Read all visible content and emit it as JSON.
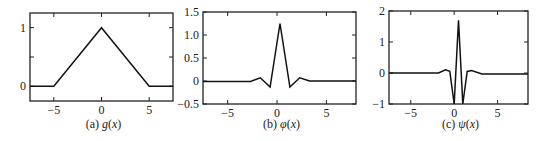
{
  "chart_data": [
    {
      "type": "line",
      "id": "a",
      "title": "",
      "caption": "(a) g(x)",
      "caption_prefix": "(a) ",
      "caption_func": "g",
      "caption_arg": "x",
      "xlabel": "",
      "ylabel": "",
      "xlim": [
        -7.5,
        7.5
      ],
      "ylim": [
        -0.25,
        1.25
      ],
      "xticks": [
        -5,
        0,
        5
      ],
      "xtick_labels": [
        "−5",
        "0",
        "5"
      ],
      "yticks": [
        0,
        0.5,
        1
      ],
      "ytick_labels": [
        "0",
        "",
        "1"
      ],
      "grid": false,
      "legend": "none",
      "series": [
        {
          "name": "g(x)",
          "x": [
            -7.5,
            -5,
            0,
            5,
            7.5
          ],
          "y": [
            0,
            0,
            1,
            0,
            0
          ]
        }
      ]
    },
    {
      "type": "line",
      "id": "b",
      "title": "",
      "caption": "(b) φ(x)",
      "caption_prefix": "(b) ",
      "caption_func": "φ",
      "caption_arg": "x",
      "xlabel": "",
      "ylabel": "",
      "xlim": [
        -7.5,
        8
      ],
      "ylim": [
        -0.5,
        1.5
      ],
      "xticks": [
        -5,
        0,
        5
      ],
      "xtick_labels": [
        "−5",
        "0",
        "5"
      ],
      "yticks": [
        -0.5,
        0,
        0.5,
        1.0,
        1.5
      ],
      "ytick_labels": [
        "−0.5",
        "0",
        "0.5",
        "1.0",
        "1.5"
      ],
      "grid": false,
      "legend": "none",
      "series": [
        {
          "name": "φ(x)",
          "x": [
            -7.5,
            -2.7,
            -1.7,
            -0.7,
            0.3,
            1.3,
            2.3,
            3.3,
            8
          ],
          "y": [
            -0.01,
            -0.01,
            0.07,
            -0.13,
            1.25,
            -0.13,
            0.07,
            0.0,
            0.0
          ]
        }
      ]
    },
    {
      "type": "line",
      "id": "c",
      "title": "",
      "caption": "(c) ψ(x)",
      "caption_prefix": "(c) ",
      "caption_func": "ψ",
      "caption_arg": "x",
      "xlabel": "",
      "ylabel": "",
      "xlim": [
        -7.5,
        8.5
      ],
      "ylim": [
        -1,
        2
      ],
      "xticks": [
        -5,
        0,
        5
      ],
      "xtick_labels": [
        "−5",
        "0",
        "5"
      ],
      "yticks": [
        -1,
        0,
        1,
        2
      ],
      "ytick_labels": [
        "−1",
        "0",
        "1",
        "2"
      ],
      "grid": false,
      "legend": "none",
      "series": [
        {
          "name": "ψ(x)",
          "x": [
            -7.5,
            -1.8,
            -1.0,
            -0.5,
            0.0,
            0.5,
            1.0,
            1.5,
            2.0,
            3.2,
            8.5
          ],
          "y": [
            0.0,
            0.0,
            0.1,
            0.05,
            -1.0,
            1.7,
            -1.0,
            0.05,
            0.08,
            -0.03,
            -0.03
          ]
        }
      ]
    }
  ]
}
